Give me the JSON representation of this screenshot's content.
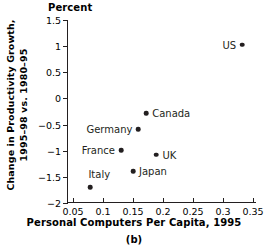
{
  "chart_data": {
    "type": "scatter",
    "title": "",
    "axis_unit_label": "Percent",
    "xlabel": "Personal Computers Per Capita, 1995",
    "ylabel_line1": "Change in Productivity Growth,",
    "ylabel_line2": "1995–98 vs. 1980–95",
    "caption": "(b)",
    "xlim": [
      0.04,
      0.355
    ],
    "ylim": [
      -2,
      1.5
    ],
    "grid": false,
    "legend": "none",
    "xticks": [
      "0.05",
      "0.1",
      "0.15",
      "0.2",
      "0.25",
      "0.3",
      "0.35"
    ],
    "xtick_values": [
      0.05,
      0.1,
      0.15,
      0.2,
      0.25,
      0.3,
      0.35
    ],
    "yticks": [
      "1.5",
      "1",
      "0.5",
      "0",
      "−0.5",
      "−1",
      "−1.5",
      "−2"
    ],
    "ytick_values": [
      1.5,
      1,
      0.5,
      0,
      -0.5,
      -1,
      -1.5,
      -2
    ],
    "points": [
      {
        "label": "US",
        "x": 0.332,
        "y": 1.03,
        "label_side": "left"
      },
      {
        "label": "Canada",
        "x": 0.172,
        "y": -0.28,
        "label_side": "right"
      },
      {
        "label": "Germany",
        "x": 0.159,
        "y": -0.59,
        "label_side": "left"
      },
      {
        "label": "France",
        "x": 0.13,
        "y": -0.99,
        "label_side": "left"
      },
      {
        "label": "UK",
        "x": 0.189,
        "y": -1.08,
        "label_side": "right"
      },
      {
        "label": "Japan",
        "x": 0.15,
        "y": -1.39,
        "label_side": "right"
      },
      {
        "label": "Italy",
        "x": 0.079,
        "y": -1.7,
        "label_side": "italy-above"
      }
    ]
  }
}
